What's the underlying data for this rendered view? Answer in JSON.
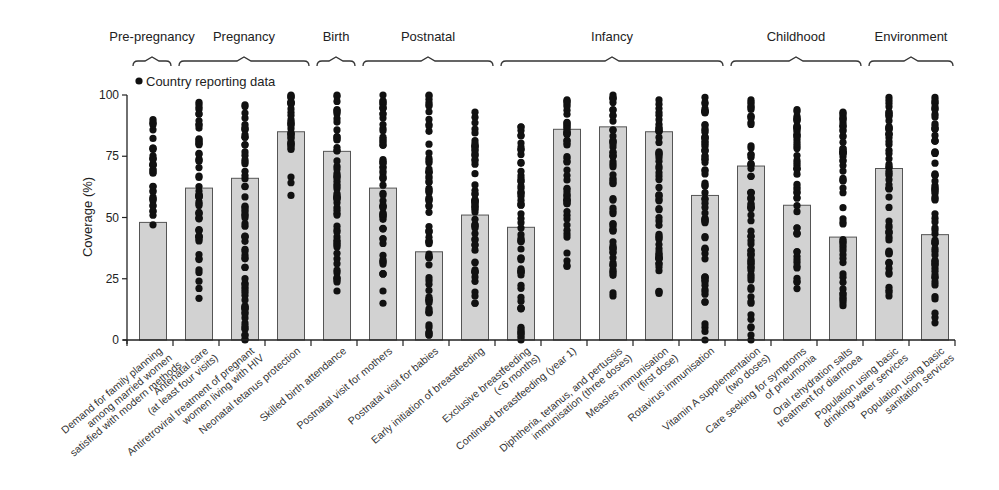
{
  "chart_data": {
    "type": "bar",
    "title": "",
    "ylabel": "Coverage (%)",
    "xlabel": "",
    "ylim": [
      0,
      100
    ],
    "yticks": [
      0,
      25,
      50,
      75,
      100
    ],
    "legend": {
      "marker": "circle",
      "label": "Country reporting data",
      "position": "top-left"
    },
    "groups": [
      {
        "label": "Pre-pregnancy",
        "start": 0,
        "end": 0
      },
      {
        "label": "Pregnancy",
        "start": 1,
        "end": 3
      },
      {
        "label": "Birth",
        "start": 4,
        "end": 4
      },
      {
        "label": "Postnatal",
        "start": 5,
        "end": 7
      },
      {
        "label": "Infancy",
        "start": 8,
        "end": 12
      },
      {
        "label": "Childhood",
        "start": 13,
        "end": 15
      },
      {
        "label": "Environment",
        "start": 16,
        "end": 17
      }
    ],
    "categories": [
      [
        "Demand for family planning",
        "among married women",
        "satisfied with modern methods"
      ],
      [
        "Antenatal care",
        "(at least four visits)"
      ],
      [
        "Antiretroviral treatment of pregnant",
        "women living with HIV"
      ],
      [
        "Neonatal tetanus protection"
      ],
      [
        "Skilled birth attendance"
      ],
      [
        "Postnatal visit for mothers"
      ],
      [
        "Postnatal visit for babies"
      ],
      [
        "Early initiation of breastfeeding"
      ],
      [
        "Exclusive breastfeeding",
        "(<6 months)"
      ],
      [
        "Continued breastfeeding (year 1)"
      ],
      [
        "Diphtheria, tetanus, and pertussis",
        "immunisation (three doses)"
      ],
      [
        "Measles immunisation",
        "(first dose)"
      ],
      [
        "Rotavirus immunisation"
      ],
      [
        "Vitamin A supplementation",
        "(two doses)"
      ],
      [
        "Care seeking for symptoms",
        "of pneumonia"
      ],
      [
        "Oral rehydration salts",
        "treatment for diarrhoea"
      ],
      [
        "Population using basic",
        "drinking-water services"
      ],
      [
        "Population using basic",
        "sanitation services"
      ]
    ],
    "values": [
      48,
      62,
      66,
      85,
      77,
      62,
      36,
      51,
      46,
      86,
      87,
      85,
      59,
      71,
      55,
      42,
      70,
      43
    ],
    "points_range": [
      [
        47,
        90
      ],
      [
        17,
        97
      ],
      [
        0,
        96
      ],
      [
        59,
        100
      ],
      [
        20,
        100
      ],
      [
        15,
        100
      ],
      [
        2,
        100
      ],
      [
        15,
        93
      ],
      [
        0,
        87
      ],
      [
        30,
        98
      ],
      [
        18,
        100
      ],
      [
        19,
        98
      ],
      [
        0,
        99
      ],
      [
        0,
        98
      ],
      [
        21,
        94
      ],
      [
        14,
        93
      ],
      [
        18,
        99
      ],
      [
        7,
        99
      ]
    ],
    "grid": false
  }
}
